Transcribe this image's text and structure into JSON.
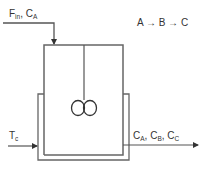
{
  "diagram": {
    "type": "jacketed CSTR process diagram",
    "reaction": "A → B → C",
    "inlet": {
      "label_main_1": "F",
      "label_sub_1": "in",
      "sep": ", ",
      "label_main_2": "C",
      "label_sub_2": "A"
    },
    "coolant": {
      "label_main": "T",
      "label_sub": "c"
    },
    "outlet": {
      "c1_main": "C",
      "c1_sub": "A",
      "c2_main": "C",
      "c2_sub": "B",
      "c3_main": "C",
      "c3_sub": "C",
      "sep": ", "
    },
    "colors": {
      "line": "#555555",
      "text": "#333333",
      "background": "#ffffff"
    }
  }
}
